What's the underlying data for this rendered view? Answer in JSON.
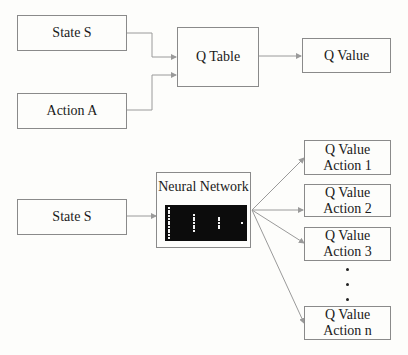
{
  "q_learning": {
    "inputs": {
      "state": "State S",
      "action": "Action A"
    },
    "table": "Q Table",
    "output": "Q Value"
  },
  "deep_q_learning": {
    "input": "State S",
    "network": {
      "title": "Neural Network",
      "layers": [
        {
          "name": "input",
          "neurons": 12
        },
        {
          "name": "hidden-1",
          "neurons": 7
        },
        {
          "name": "hidden-2",
          "neurons": 5
        },
        {
          "name": "output",
          "neurons": 1
        }
      ]
    },
    "outputs": [
      {
        "line1": "Q Value",
        "line2": "Action 1"
      },
      {
        "line1": "Q Value",
        "line2": "Action 2"
      },
      {
        "line1": "Q Value",
        "line2": "Action 3"
      },
      {
        "line1": "Q Value",
        "line2": "Action n"
      }
    ],
    "ellipsis_dots": 3
  },
  "colors": {
    "line": "#9a9a9a",
    "border": "#8a8a8a",
    "panel": "#0c0c0c",
    "neuron": "#f2f2f2"
  }
}
